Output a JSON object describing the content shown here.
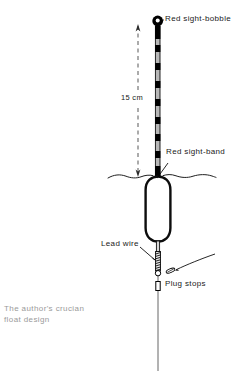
{
  "figure": {
    "caption": "The author's crucian\nfloat design",
    "labels": {
      "bobble": "Red sight-bobble",
      "sight_band": "Red sight-band",
      "dimension": "15 cm",
      "lead_wire": "Lead wire",
      "plug_stops": "Plug stops"
    },
    "colors": {
      "ink": "#000000",
      "stem_fill": "#b5b5b5",
      "caption": "#9a9a9a",
      "background": "#ffffff"
    },
    "parts": [
      {
        "name": "red-sight-bobble",
        "shape": "ring",
        "cx": 158,
        "cy": 21,
        "r": 5.2
      },
      {
        "name": "antenna-stem",
        "shape": "banded-rod",
        "x": 158,
        "y_top": 26,
        "y_bottom": 176,
        "bands": 9
      },
      {
        "name": "dimension-arrow",
        "shape": "dashed-double-arrow",
        "x": 138,
        "y_top": 25,
        "y_bottom": 176,
        "value": "15 cm"
      },
      {
        "name": "waterline",
        "shape": "wavy-line",
        "y": 176,
        "x_start": 108,
        "x_end": 216
      },
      {
        "name": "float-body",
        "shape": "capsule",
        "cx": 158,
        "cy": 208,
        "width": 26,
        "height": 66
      },
      {
        "name": "lower-stem",
        "shape": "rod",
        "x": 158,
        "y_top": 241,
        "y_bottom": 272
      },
      {
        "name": "lead-wire-coil",
        "shape": "coil",
        "x": 158,
        "y_top": 252,
        "y_bottom": 270
      },
      {
        "name": "ring",
        "shape": "small-circle",
        "cx": 158,
        "cy": 272,
        "r": 2.6
      },
      {
        "name": "plug-stop-upper",
        "shape": "angled-capsule",
        "cx": 170,
        "cy": 270
      },
      {
        "name": "plug-stop-lower",
        "shape": "rect-stop",
        "cx": 158,
        "cy": 286
      },
      {
        "name": "main-line",
        "shape": "line",
        "x": 158,
        "y_top": 274,
        "y_bottom": 371
      }
    ]
  }
}
